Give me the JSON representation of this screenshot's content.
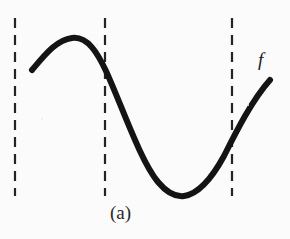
{
  "figure": {
    "panel_label": "(a)",
    "function_label": "f",
    "background_color": "#fbfbfb",
    "curve_color": "#141414",
    "dashed_line_color": "#242424",
    "canvas": {
      "width": 290,
      "height": 239
    }
  },
  "chart_data": {
    "type": "line",
    "title": "(a)",
    "xlabel": "",
    "ylabel": "",
    "grid": false,
    "legend": null,
    "axis_visible": false,
    "xlim": [
      0,
      290
    ],
    "ylim": [
      239,
      0
    ],
    "annotations": [
      {
        "text": "f",
        "x": 262,
        "y": 60,
        "style": "italic-serif"
      },
      {
        "text": "(a)",
        "x": 124,
        "y": 213,
        "style": "serif"
      }
    ],
    "vertical_dashed_lines": [
      {
        "name": "left-boundary",
        "x": 15,
        "y_top": 18,
        "y_bottom": 196
      },
      {
        "name": "middle-boundary",
        "x": 105,
        "y_top": 18,
        "y_bottom": 196
      },
      {
        "name": "right-boundary",
        "x": 232,
        "y_top": 18,
        "y_bottom": 196
      }
    ],
    "dash_pattern": {
      "dash": 10,
      "gap": 7,
      "width": 2.2
    },
    "curve": {
      "name": "f",
      "stroke_width": 6,
      "path": "M 32 70 C 44 56, 56 40, 72 38 C 88 36, 98 54, 106 71 C 122 106, 140 160, 158 182 C 168 194, 176 197, 184 196 C 198 194, 212 178, 224 156 C 236 132, 252 100, 270 80",
      "key_points": [
        {
          "label": "left-endpoint",
          "x": 32,
          "y": 70
        },
        {
          "label": "local-maximum",
          "x": 72,
          "y": 38
        },
        {
          "label": "inflection-at-middle-line",
          "x": 106,
          "y": 71
        },
        {
          "label": "local-minimum",
          "x": 184,
          "y": 196
        },
        {
          "label": "crossing-right-line",
          "x": 232,
          "y": 140
        },
        {
          "label": "right-endpoint",
          "x": 270,
          "y": 80
        }
      ]
    }
  }
}
